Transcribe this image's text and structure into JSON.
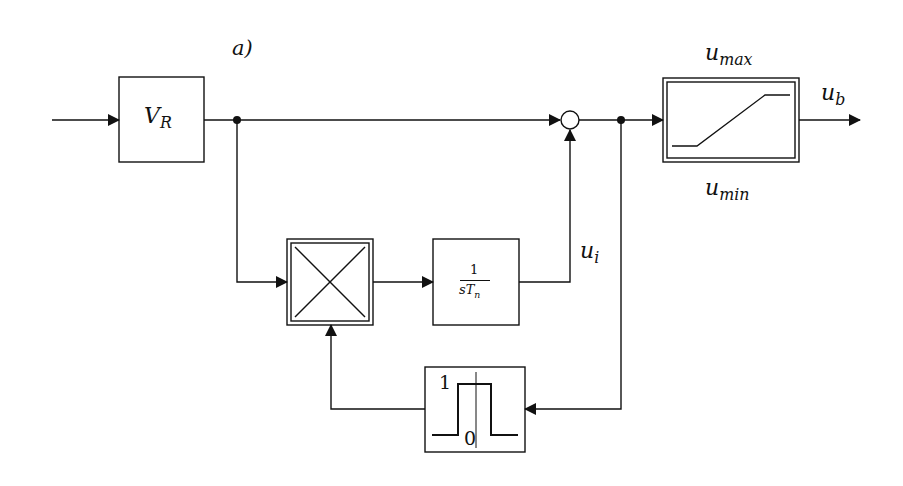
{
  "diagram": {
    "label": "a)",
    "blocks": {
      "gain": {
        "main": "V",
        "sub": "R"
      },
      "integrator": {
        "num": "1",
        "den_main": "sT",
        "den_sub": "n"
      },
      "multiplier": {
        "symbol": "×"
      },
      "saturation": {
        "name": "saturation"
      },
      "window": {
        "high": "1",
        "low": "0"
      }
    },
    "signals": {
      "ui": {
        "main": "u",
        "sub": "i"
      },
      "ub": {
        "main": "u",
        "sub": "b"
      },
      "umax": {
        "main": "u",
        "sub": "max"
      },
      "umin": {
        "main": "u",
        "sub": "min"
      }
    }
  }
}
